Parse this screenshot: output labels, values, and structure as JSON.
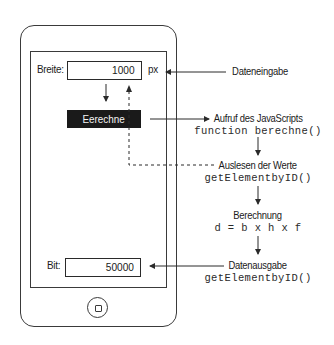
{
  "phone": {
    "input": {
      "label": "Breite:",
      "value": "1000",
      "unit": "px"
    },
    "button": {
      "label": "Eerechne"
    },
    "output": {
      "label": "Bit:",
      "value": "50000"
    },
    "home_button_icon": "home-button-icon"
  },
  "steps": [
    {
      "title": "Dateneingabe",
      "code": ""
    },
    {
      "title": "Aufruf des JavaScripts",
      "code": "function berechne()"
    },
    {
      "title": "Auslesen der Werte",
      "code": "getElementbyID()"
    },
    {
      "title": "Berechnung",
      "code": "d = b x h x f"
    },
    {
      "title": "Datenausgabe",
      "code": "getElementbyID()"
    }
  ],
  "colors": {
    "line": "#2a2a2a",
    "button_bg": "#1a1a1a",
    "button_text": "#f4f4f4"
  }
}
